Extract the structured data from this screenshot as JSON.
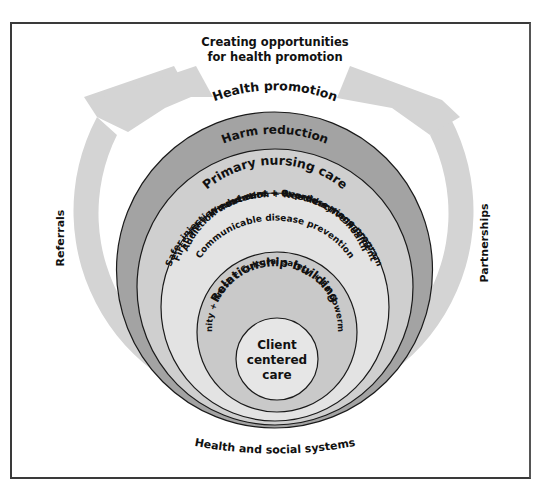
{
  "diagram": {
    "title_line1": "Creating opportunities",
    "title_line2": "for health promotion",
    "left_label": "Referrals",
    "right_label": "Partnerships",
    "bottom_label": "Health and social systems",
    "rings": [
      {
        "label": "Health promotion",
        "color": "#a3a3a3"
      },
      {
        "label": "Harm reduction",
        "color": "#cfcfcf"
      },
      {
        "label": "Primary nursing care",
        "color": "#e3e3e3",
        "lines": [
          "Safer injection education + Needle-syringe program",
          "First aid + Wound care + Overdose management",
          "Addiction treatment + Reproductive health",
          "Communicable disease prevention"
        ]
      },
      {
        "label": "Relationship building",
        "color": "#c9c9c9",
        "sub": "Dignity + Trust + Cultural safety + Empowerment"
      },
      {
        "label_lines": [
          "Client",
          "centered",
          "care"
        ],
        "color": "#e6e6e6"
      }
    ],
    "colors": {
      "arrow": "#d4d4d4",
      "outline": "#1a1a1a",
      "frame": "#3a3a3a"
    }
  }
}
